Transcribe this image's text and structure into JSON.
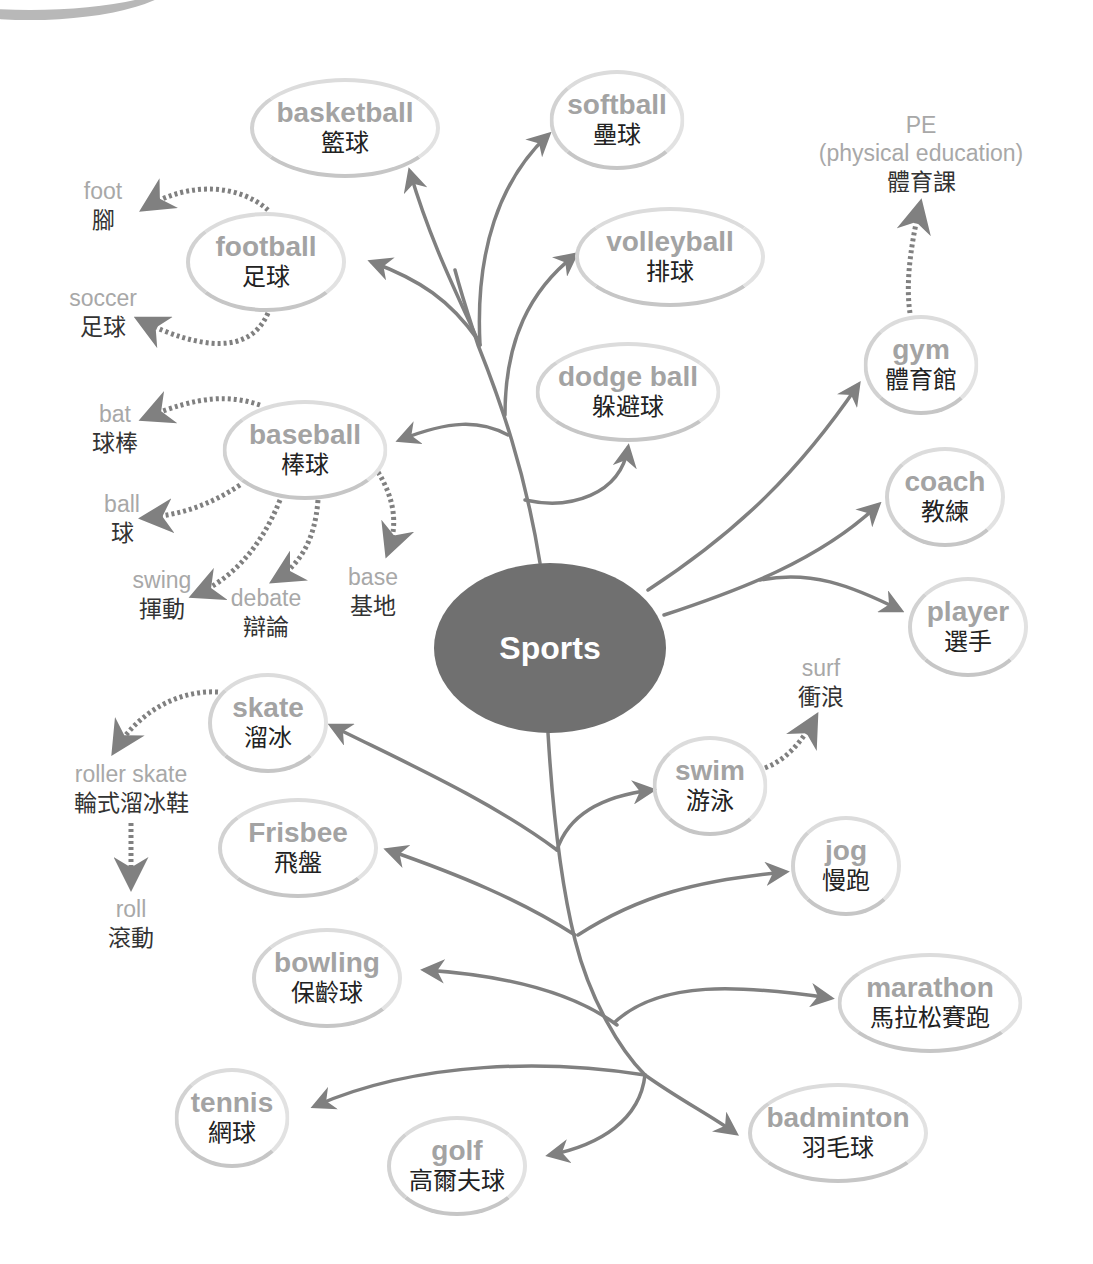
{
  "colors": {
    "center_fill": "#707070",
    "center_text": "#ffffff",
    "branch_line": "#808080",
    "node_border": "#cfcfcf",
    "node_english": "#a3a3a3",
    "node_chinese": "#222222",
    "leaf_english": "#a8a8a8",
    "leaf_chinese": "#333333"
  },
  "center": {
    "label": "Sports"
  },
  "nodes": [
    {
      "id": "basketball",
      "en": "basketball",
      "zh": "籃球",
      "x": 345,
      "y": 128,
      "w": 190,
      "h": 100
    },
    {
      "id": "softball",
      "en": "softball",
      "zh": "壘球",
      "x": 617,
      "y": 120,
      "w": 135,
      "h": 100
    },
    {
      "id": "football",
      "en": "football",
      "zh": "足球",
      "x": 266,
      "y": 262,
      "w": 160,
      "h": 100
    },
    {
      "id": "volleyball",
      "en": "volleyball",
      "zh": "排球",
      "x": 670,
      "y": 257,
      "w": 190,
      "h": 100
    },
    {
      "id": "dodgeball",
      "en": "dodge ball",
      "zh": "躲避球",
      "x": 628,
      "y": 392,
      "w": 185,
      "h": 100
    },
    {
      "id": "gym",
      "en": "gym",
      "zh": "體育館",
      "x": 921,
      "y": 365,
      "w": 115,
      "h": 100
    },
    {
      "id": "baseball",
      "en": "baseball",
      "zh": "棒球",
      "x": 305,
      "y": 450,
      "w": 165,
      "h": 100
    },
    {
      "id": "coach",
      "en": "coach",
      "zh": "教練",
      "x": 945,
      "y": 497,
      "w": 120,
      "h": 100
    },
    {
      "id": "player",
      "en": "player",
      "zh": "選手",
      "x": 968,
      "y": 627,
      "w": 120,
      "h": 100
    },
    {
      "id": "skate",
      "en": "skate",
      "zh": "溜冰",
      "x": 268,
      "y": 723,
      "w": 120,
      "h": 100
    },
    {
      "id": "swim",
      "en": "swim",
      "zh": "游泳",
      "x": 710,
      "y": 786,
      "w": 115,
      "h": 100
    },
    {
      "id": "frisbee",
      "en": "Frisbee",
      "zh": "飛盤",
      "x": 298,
      "y": 848,
      "w": 160,
      "h": 100
    },
    {
      "id": "jog",
      "en": "jog",
      "zh": "慢跑",
      "x": 846,
      "y": 866,
      "w": 110,
      "h": 100
    },
    {
      "id": "bowling",
      "en": "bowling",
      "zh": "保齡球",
      "x": 327,
      "y": 978,
      "w": 150,
      "h": 100
    },
    {
      "id": "marathon",
      "en": "marathon",
      "zh": "馬拉松賽跑",
      "x": 930,
      "y": 1003,
      "w": 185,
      "h": 100
    },
    {
      "id": "tennis",
      "en": "tennis",
      "zh": "網球",
      "x": 232,
      "y": 1118,
      "w": 115,
      "h": 100
    },
    {
      "id": "badminton",
      "en": "badminton",
      "zh": "羽毛球",
      "x": 838,
      "y": 1133,
      "w": 180,
      "h": 100
    },
    {
      "id": "golf",
      "en": "golf",
      "zh": "高爾夫球",
      "x": 457,
      "y": 1166,
      "w": 140,
      "h": 100
    }
  ],
  "leaves": [
    {
      "id": "foot",
      "en": "foot",
      "zh": "腳",
      "x": 103,
      "y": 206
    },
    {
      "id": "soccer",
      "en": "soccer",
      "zh": "足球",
      "x": 103,
      "y": 313
    },
    {
      "id": "pe",
      "en": "PE",
      "en2": "(physical education)",
      "zh": "體育課",
      "x": 921,
      "y": 154
    },
    {
      "id": "bat",
      "en": "bat",
      "zh": "球棒",
      "x": 115,
      "y": 429
    },
    {
      "id": "ball",
      "en": "ball",
      "zh": "球",
      "x": 122,
      "y": 519
    },
    {
      "id": "swing",
      "en": "swing",
      "zh": "揮動",
      "x": 162,
      "y": 595
    },
    {
      "id": "debate",
      "en": "debate",
      "zh": "辯論",
      "x": 266,
      "y": 613
    },
    {
      "id": "base",
      "en": "base",
      "zh": "基地",
      "x": 373,
      "y": 592
    },
    {
      "id": "surf",
      "en": "surf",
      "zh": "衝浪",
      "x": 821,
      "y": 683
    },
    {
      "id": "roller-skate",
      "en": "roller skate",
      "zh": "輪式溜冰鞋",
      "x": 131,
      "y": 789
    },
    {
      "id": "roll",
      "en": "roll",
      "zh": "滾動",
      "x": 131,
      "y": 924
    }
  ]
}
